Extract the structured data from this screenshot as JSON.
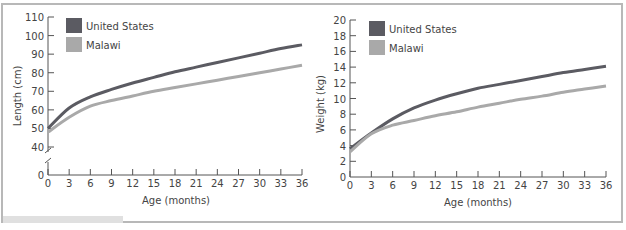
{
  "chart_data": [
    {
      "type": "line",
      "title": "",
      "xlabel": "Age (months)",
      "ylabel": "Length (cm)",
      "x": [
        0,
        3,
        6,
        9,
        12,
        15,
        18,
        21,
        24,
        27,
        30,
        33,
        36
      ],
      "xticks": [
        "0",
        "3",
        "6",
        "9",
        "12",
        "15",
        "18",
        "21",
        "24",
        "27",
        "30",
        "33",
        "36"
      ],
      "yticks": [
        "0",
        "40",
        "50",
        "60",
        "70",
        "80",
        "90",
        "100",
        "110"
      ],
      "ylim": [
        0,
        110
      ],
      "axis_break": "between 0 and 40",
      "legend": [
        "United States",
        "Malawi"
      ],
      "legend_position": "upper left",
      "series": [
        {
          "name": "United States",
          "color": "#5b5b62",
          "values": [
            50,
            61,
            67,
            71,
            74.5,
            77.5,
            80.5,
            83,
            85.5,
            88,
            90.5,
            93,
            95
          ]
        },
        {
          "name": "Malawi",
          "color": "#a9a9a9",
          "values": [
            48,
            56,
            62,
            65,
            67.5,
            70,
            72,
            74,
            76,
            78,
            80,
            82,
            84
          ]
        }
      ]
    },
    {
      "type": "line",
      "title": "",
      "xlabel": "Age (months)",
      "ylabel": "Weight (kg)",
      "x": [
        0,
        3,
        6,
        9,
        12,
        15,
        18,
        21,
        24,
        27,
        30,
        33,
        36
      ],
      "xticks": [
        "0",
        "3",
        "6",
        "9",
        "12",
        "15",
        "18",
        "21",
        "24",
        "27",
        "30",
        "33",
        "36"
      ],
      "yticks": [
        "0",
        "2",
        "4",
        "6",
        "8",
        "10",
        "12",
        "14",
        "16",
        "18",
        "20"
      ],
      "ylim": [
        0,
        20
      ],
      "legend": [
        "United States",
        "Malawi"
      ],
      "legend_position": "upper left",
      "series": [
        {
          "name": "United States",
          "color": "#5b5b62",
          "values": [
            3.6,
            5.6,
            7.4,
            8.8,
            9.8,
            10.6,
            11.3,
            11.8,
            12.3,
            12.8,
            13.3,
            13.7,
            14.1
          ]
        },
        {
          "name": "Malawi",
          "color": "#a9a9a9",
          "values": [
            3.2,
            5.5,
            6.6,
            7.2,
            7.8,
            8.3,
            8.9,
            9.4,
            9.9,
            10.3,
            10.8,
            11.2,
            11.6
          ]
        }
      ]
    }
  ],
  "charts": {
    "left": {
      "ylabel": "Length (cm)",
      "xlabel": "Age (months)",
      "legend_us": "United States",
      "legend_mw": "Malawi"
    },
    "right": {
      "ylabel": "Weight (kg)",
      "xlabel": "Age (months)",
      "legend_us": "United States",
      "legend_mw": "Malawi"
    }
  }
}
